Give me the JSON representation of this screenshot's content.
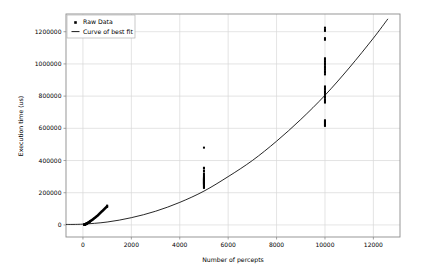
{
  "chart_data": {
    "type": "scatter",
    "title": "",
    "xlabel": "Number of percepts",
    "ylabel": "Execution time (us)",
    "xlim": [
      -700,
      13100
    ],
    "ylim": [
      -75000,
      1310000
    ],
    "xticks": [
      0,
      2000,
      4000,
      6000,
      8000,
      10000,
      12000
    ],
    "xtick_labels": [
      "0",
      "2000",
      "4000",
      "6000",
      "8000",
      "10000",
      "12000"
    ],
    "yticks": [
      0,
      200000,
      400000,
      600000,
      800000,
      1000000,
      1200000
    ],
    "ytick_labels": [
      "0",
      "200000",
      "400000",
      "600000",
      "800000",
      "1000000",
      "1200000"
    ],
    "grid": true,
    "legend_position": "upper left",
    "series": [
      {
        "name": "Raw Data",
        "type": "scatter",
        "marker": "square",
        "color": "#000000",
        "points": [
          [
            50,
            1500
          ],
          [
            55,
            1800
          ],
          [
            60,
            2000
          ],
          [
            65,
            2200
          ],
          [
            70,
            2500
          ],
          [
            75,
            2800
          ],
          [
            80,
            3000
          ],
          [
            85,
            3300
          ],
          [
            90,
            3600
          ],
          [
            95,
            3900
          ],
          [
            100,
            4200
          ],
          [
            105,
            4600
          ],
          [
            110,
            5000
          ],
          [
            115,
            5300
          ],
          [
            120,
            5600
          ],
          [
            125,
            6000
          ],
          [
            130,
            6400
          ],
          [
            135,
            6800
          ],
          [
            140,
            7200
          ],
          [
            145,
            7600
          ],
          [
            150,
            8000
          ],
          [
            160,
            8800
          ],
          [
            170,
            9600
          ],
          [
            180,
            10400
          ],
          [
            190,
            11200
          ],
          [
            200,
            12000
          ],
          [
            210,
            13000
          ],
          [
            220,
            14000
          ],
          [
            230,
            15000
          ],
          [
            240,
            16000
          ],
          [
            250,
            17000
          ],
          [
            260,
            18000
          ],
          [
            270,
            19000
          ],
          [
            280,
            20000
          ],
          [
            290,
            21500
          ],
          [
            300,
            23000
          ],
          [
            320,
            25000
          ],
          [
            340,
            27000
          ],
          [
            360,
            29000
          ],
          [
            380,
            31000
          ],
          [
            400,
            33000
          ],
          [
            420,
            35500
          ],
          [
            440,
            38000
          ],
          [
            460,
            40500
          ],
          [
            480,
            43000
          ],
          [
            500,
            45000
          ],
          [
            520,
            47500
          ],
          [
            540,
            50000
          ],
          [
            560,
            52500
          ],
          [
            580,
            55000
          ],
          [
            600,
            57000
          ],
          [
            620,
            60000
          ],
          [
            640,
            63000
          ],
          [
            660,
            66000
          ],
          [
            680,
            69000
          ],
          [
            700,
            72000
          ],
          [
            720,
            75000
          ],
          [
            740,
            78000
          ],
          [
            760,
            81000
          ],
          [
            780,
            84000
          ],
          [
            800,
            86000
          ],
          [
            820,
            89000
          ],
          [
            840,
            92000
          ],
          [
            860,
            95000
          ],
          [
            880,
            98000
          ],
          [
            900,
            101000
          ],
          [
            920,
            104000
          ],
          [
            940,
            107000
          ],
          [
            960,
            110000
          ],
          [
            980,
            113000
          ],
          [
            1000,
            116000
          ],
          [
            1000,
            120000
          ],
          [
            1000,
            112000
          ],
          [
            5000,
            230000
          ],
          [
            5000,
            235000
          ],
          [
            5000,
            240000
          ],
          [
            5000,
            245000
          ],
          [
            5000,
            250000
          ],
          [
            5000,
            252000
          ],
          [
            5000,
            255000
          ],
          [
            5000,
            258000
          ],
          [
            5000,
            260000
          ],
          [
            5000,
            262000
          ],
          [
            5000,
            265000
          ],
          [
            5000,
            268000
          ],
          [
            5000,
            270000
          ],
          [
            5000,
            272000
          ],
          [
            5000,
            275000
          ],
          [
            5000,
            278000
          ],
          [
            5000,
            280000
          ],
          [
            5000,
            282000
          ],
          [
            5000,
            285000
          ],
          [
            5000,
            288000
          ],
          [
            5000,
            290000
          ],
          [
            5000,
            295000
          ],
          [
            5000,
            300000
          ],
          [
            5000,
            310000
          ],
          [
            5000,
            320000
          ],
          [
            5000,
            335000
          ],
          [
            5000,
            350000
          ],
          [
            5000,
            355000
          ],
          [
            5000,
            480000
          ],
          [
            10000,
            615000
          ],
          [
            10000,
            620000
          ],
          [
            10000,
            625000
          ],
          [
            10000,
            630000
          ],
          [
            10000,
            635000
          ],
          [
            10000,
            640000
          ],
          [
            10000,
            645000
          ],
          [
            10000,
            650000
          ],
          [
            10000,
            760000
          ],
          [
            10000,
            770000
          ],
          [
            10000,
            780000
          ],
          [
            10000,
            790000
          ],
          [
            10000,
            800000
          ],
          [
            10000,
            810000
          ],
          [
            10000,
            820000
          ],
          [
            10000,
            830000
          ],
          [
            10000,
            840000
          ],
          [
            10000,
            850000
          ],
          [
            10000,
            860000
          ],
          [
            10000,
            935000
          ],
          [
            10000,
            945000
          ],
          [
            10000,
            955000
          ],
          [
            10000,
            965000
          ],
          [
            10000,
            975000
          ],
          [
            10000,
            985000
          ],
          [
            10000,
            995000
          ],
          [
            10000,
            1005000
          ],
          [
            10000,
            1015000
          ],
          [
            10000,
            1025000
          ],
          [
            10000,
            1035000
          ],
          [
            10000,
            1150000
          ],
          [
            10000,
            1160000
          ],
          [
            10000,
            1205000
          ],
          [
            10000,
            1215000
          ],
          [
            10000,
            1225000
          ]
        ]
      },
      {
        "name": "Curve of best fit",
        "type": "line",
        "color": "#000000",
        "equation_note": "quadratic",
        "fit_points": [
          [
            -700,
            3000
          ],
          [
            0,
            5000
          ],
          [
            1000,
            18000
          ],
          [
            2000,
            45000
          ],
          [
            3000,
            85000
          ],
          [
            4000,
            140000
          ],
          [
            5000,
            210000
          ],
          [
            6000,
            300000
          ],
          [
            7000,
            400000
          ],
          [
            8000,
            520000
          ],
          [
            9000,
            655000
          ],
          [
            10000,
            805000
          ],
          [
            11000,
            975000
          ],
          [
            12000,
            1160000
          ],
          [
            12600,
            1280000
          ]
        ]
      }
    ]
  },
  "legend": {
    "entries": [
      {
        "label": "Raw Data",
        "marker": "square",
        "color": "#000000"
      },
      {
        "label": "Curve of best fit",
        "marker": "line",
        "color": "#000000"
      }
    ]
  },
  "style": {
    "background": "#ffffff",
    "grid_color": "#d9d9d9",
    "frame_color": "#8c8c8c",
    "data_color": "#000000",
    "text_color": "#000000"
  }
}
